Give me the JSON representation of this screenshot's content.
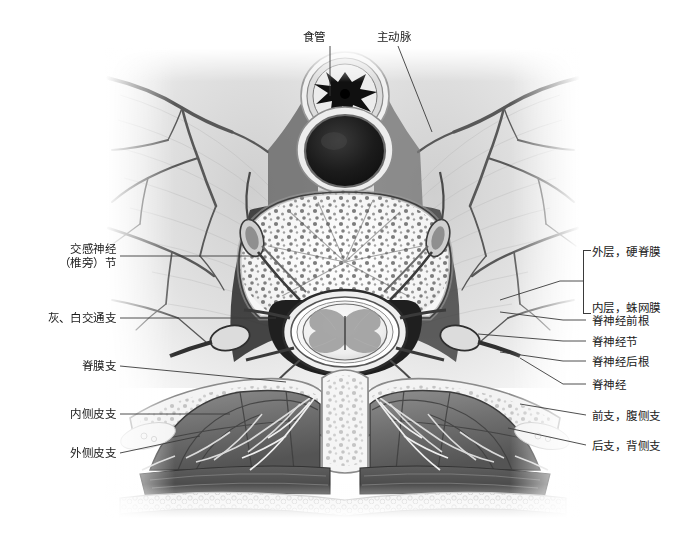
{
  "figure": {
    "type": "anatomical-cross-section",
    "background_color": "#ffffff",
    "ink_color": "#1a1a1a",
    "leader_color": "#3a3a3a"
  },
  "labels": {
    "top": [
      {
        "id": "esophagus",
        "text": "食管",
        "x": 303,
        "y": 30,
        "align": "left"
      },
      {
        "id": "aorta",
        "text": "主动脉",
        "x": 377,
        "y": 30,
        "align": "left"
      }
    ],
    "left": [
      {
        "id": "sympathetic-ganglion",
        "lines": [
          "交感神经",
          "（椎旁）节"
        ],
        "x": 46,
        "y": 242,
        "align": "right"
      },
      {
        "id": "gray-white-rami",
        "lines": [
          "灰、白交通支"
        ],
        "x": 30,
        "y": 313,
        "align": "right"
      },
      {
        "id": "meningeal-branch",
        "lines": [
          "脊膜支"
        ],
        "x": 66,
        "y": 362,
        "align": "right"
      },
      {
        "id": "medial-cutaneous-branch",
        "lines": [
          "内侧皮支"
        ],
        "x": 54,
        "y": 409,
        "align": "right"
      },
      {
        "id": "lateral-cutaneous-branch",
        "lines": [
          "外侧皮支"
        ],
        "x": 54,
        "y": 449,
        "align": "right"
      }
    ],
    "right": [
      {
        "id": "dura-mater",
        "lines": [
          "外层，硬脊膜"
        ],
        "x": 592,
        "y": 245,
        "align": "left"
      },
      {
        "id": "arachnoid-mater",
        "lines": [
          "内层，蛛网膜"
        ],
        "x": 592,
        "y": 301,
        "align": "left"
      },
      {
        "id": "ventral-root",
        "lines": [
          "脊神经前根"
        ],
        "x": 592,
        "y": 316,
        "align": "left"
      },
      {
        "id": "spinal-ganglion",
        "lines": [
          "脊神经节"
        ],
        "x": 592,
        "y": 337,
        "align": "left"
      },
      {
        "id": "dorsal-root",
        "lines": [
          "脊神经后根"
        ],
        "x": 592,
        "y": 357,
        "align": "left"
      },
      {
        "id": "spinal-nerve",
        "lines": [
          "脊神经"
        ],
        "x": 592,
        "y": 380,
        "align": "left"
      },
      {
        "id": "ventral-ramus",
        "lines": [
          "前支，腹侧支"
        ],
        "x": 592,
        "y": 411,
        "align": "left"
      },
      {
        "id": "dorsal-ramus",
        "lines": [
          "后支，背侧支"
        ],
        "x": 592,
        "y": 441,
        "align": "left"
      }
    ],
    "bracket_group": {
      "id": "spinal-meninges-bracket",
      "members": [
        "外层，硬脊膜",
        "内层，蛛网膜"
      ],
      "x": 583,
      "y": 250,
      "height": 62
    }
  },
  "structures": {
    "esophagus": "食管",
    "aorta": "主动脉",
    "vertebral_body": "椎体",
    "spinal_cord": "脊髓",
    "lung_left": "左肺",
    "lung_right": "右肺",
    "erector_spinae": "竖脊肌",
    "skin_fat": "皮肤与皮下脂肪"
  }
}
